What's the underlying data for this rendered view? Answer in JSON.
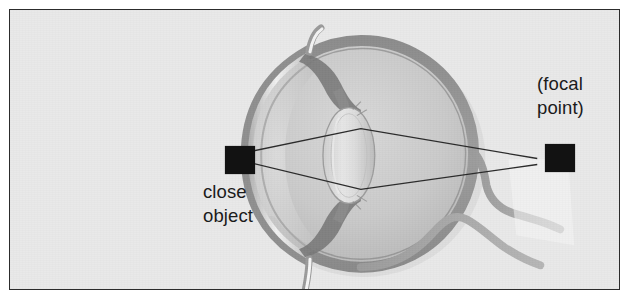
{
  "figure": {
    "background_color": "#e9e9e9",
    "border_color": "#2c2c2c",
    "page_color": "#ffffff"
  },
  "labels": {
    "close_object": {
      "line1": "close",
      "line2": "object"
    },
    "focal_point": {
      "line1": "(focal",
      "line2": "point)"
    }
  },
  "markers": {
    "close_object_marker": {
      "shape": "filled-square",
      "color": "#121212"
    },
    "focal_point_marker": {
      "shape": "filled-square",
      "color": "#121212"
    }
  },
  "anatomy": {
    "sclera_color": "#8e8e8e",
    "globe_fill": "#c9c9c9",
    "cornea_color": "#9a9a9a",
    "cornea_highlight": "#f4f4f4",
    "lens_color": "#d6d6d6",
    "iris_color": "#7d7d7d",
    "vessel_color": "#a0a0a0",
    "parts": [
      "cornea",
      "anterior-chamber",
      "iris",
      "lens",
      "ciliary-body",
      "sclera",
      "retina",
      "vitreous-chamber",
      "optic-nerve",
      "blood-vessel"
    ]
  },
  "rays": {
    "color": "#2a2a2a",
    "width": 1.3,
    "count": 2,
    "description": "two light rays from close object refracting through the lens and converging at the focal point behind the eye"
  }
}
